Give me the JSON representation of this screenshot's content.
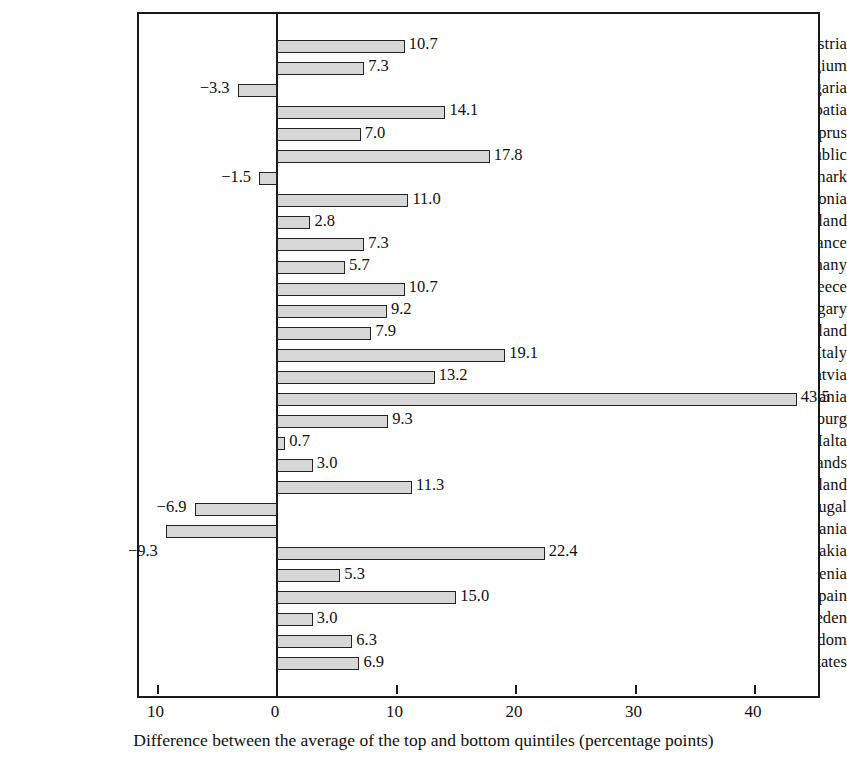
{
  "chart_data": {
    "type": "bar",
    "orientation": "horizontal",
    "title": "",
    "xlabel": "Difference between the average of the top and bottom quintiles (percentage points)",
    "ylabel": "",
    "xlim": [
      -13.2,
      44.9
    ],
    "xticks": [
      -10,
      0,
      10,
      20,
      30,
      40
    ],
    "xticklabels": [
      "10",
      "0",
      "10",
      "20",
      "30",
      "40"
    ],
    "grid": false,
    "legend": null,
    "zero_reference_line": true,
    "categories": [
      "Austria",
      "Belgium",
      "Bulgaria",
      "Croatia",
      "Cyprus",
      "Czech Republic",
      "Denmark",
      "Estonia",
      "Finland",
      "France",
      "Germany",
      "Greece",
      "Hungary",
      "Ireland",
      "Italy",
      "Latvia",
      "Lithuania",
      "Luxembourg",
      "Malta",
      "Netherlands",
      "Poland",
      "Portugal",
      "Romania",
      "Slovakia",
      "Slovenia",
      "Spain",
      "Sweden",
      "United Kingdom",
      "United States"
    ],
    "values": [
      10.7,
      7.3,
      -3.3,
      14.1,
      7.0,
      17.8,
      -1.5,
      11.0,
      2.8,
      7.3,
      5.7,
      10.7,
      9.2,
      7.9,
      19.1,
      13.2,
      43.5,
      9.3,
      0.7,
      3.0,
      11.3,
      -6.9,
      -9.3,
      22.4,
      5.3,
      15.0,
      3.0,
      6.3,
      6.9
    ],
    "value_labels": [
      "10.7",
      "7.3",
      "−3.3",
      "14.1",
      "7.0",
      "17.8",
      "−1.5",
      "11.0",
      "2.8",
      "7.3",
      "5.7",
      "10.7",
      "9.2",
      "7.9",
      "19.1",
      "13.2",
      "43.5",
      "9.3",
      "0.7",
      "3.0",
      "11.3",
      "−6.9",
      "−9.3",
      "22.4",
      "5.3",
      "15.0",
      "3.0",
      "6.3",
      "6.9"
    ],
    "colors": {
      "bar_fill": "#d7d7d7",
      "bar_edge": "#232323",
      "axis": "#1a1a1a",
      "text": "#101010",
      "background": "#ffffff"
    }
  }
}
